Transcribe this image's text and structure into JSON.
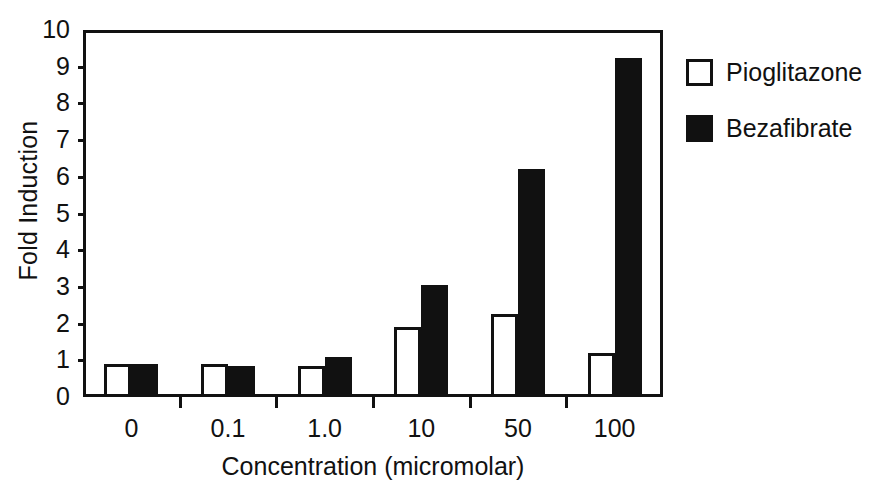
{
  "chart_data": {
    "type": "bar",
    "title": "",
    "xlabel": "Concentration (micromolar)",
    "ylabel": "Fold Induction",
    "categories": [
      "0",
      "0.1",
      "1.0",
      "10",
      "50",
      "100"
    ],
    "series": [
      {
        "name": "Pioglitazone",
        "style": "open",
        "values": [
          0.9,
          0.9,
          0.85,
          1.9,
          2.25,
          1.2
        ]
      },
      {
        "name": "Bezafibrate",
        "style": "filled",
        "values": [
          0.9,
          0.85,
          1.1,
          3.05,
          6.2,
          9.25
        ]
      }
    ],
    "ylim": [
      0,
      10
    ],
    "yticks": [
      "10",
      "9",
      "8",
      "7",
      "6",
      "5",
      "4",
      "3",
      "2",
      "1",
      "0"
    ],
    "grid": false,
    "legend_position": "right",
    "colors": {
      "open_fill": "#ffffff",
      "filled_fill": "#111111",
      "axis": "#111111"
    }
  },
  "legend": {
    "entries": [
      {
        "label": "Pioglitazone",
        "style": "open"
      },
      {
        "label": "Bezafibrate",
        "style": "filled"
      }
    ]
  }
}
